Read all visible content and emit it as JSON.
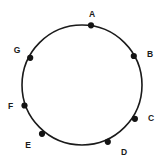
{
  "figure": {
    "type": "circle-point-diagram",
    "background_color": "#ffffff",
    "stroke_color": "#1a1a1a",
    "label_color": "#1a1a1a",
    "circle": {
      "center_x": 82,
      "center_y": 85,
      "radius": 60,
      "stroke_width": 1.6
    },
    "marker": {
      "shape": "filled-circle",
      "radius": 3.1,
      "fill_color": "#141414"
    },
    "points": [
      {
        "label": "A",
        "point_x": 91,
        "point_y": 25.3,
        "label_x": 92,
        "label_y": 14,
        "angle_deg": -81.4
      },
      {
        "label": "B",
        "point_x": 133.8,
        "point_y": 56.0,
        "label_x": 150,
        "label_y": 54,
        "angle_deg": -27.2
      },
      {
        "label": "C",
        "point_x": 134.9,
        "point_y": 118.8,
        "label_x": 151,
        "label_y": 118,
        "angle_deg": 29.2
      },
      {
        "label": "D",
        "point_x": 107.8,
        "point_y": 141.8,
        "label_x": 124,
        "label_y": 152,
        "angle_deg": 65.7
      },
      {
        "label": "E",
        "point_x": 42.0,
        "point_y": 133.8,
        "label_x": 28,
        "label_y": 144.5,
        "angle_deg": 125.6
      },
      {
        "label": "F",
        "point_x": 24.5,
        "point_y": 105.5,
        "label_x": 10.5,
        "label_y": 106,
        "angle_deg": 159.9
      },
      {
        "label": "G",
        "point_x": 30.2,
        "point_y": 57.8,
        "label_x": 17,
        "label_y": 50,
        "angle_deg": -152.9
      }
    ]
  }
}
